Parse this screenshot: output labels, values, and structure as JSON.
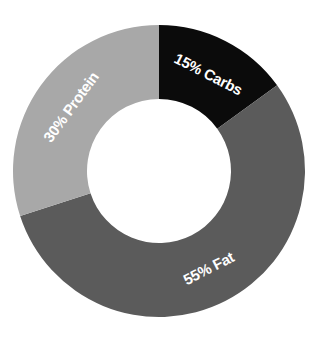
{
  "chart_data": {
    "type": "pie",
    "variant": "donut",
    "title": "",
    "categories": [
      "Carbs",
      "Fat",
      "Protein"
    ],
    "values": [
      15,
      55,
      30
    ],
    "unit": "%",
    "labels": [
      "15% Carbs",
      "55% Fat",
      "30% Protein"
    ],
    "colors": [
      "#0b0b0b",
      "#5b5b5b",
      "#a8a8a8"
    ],
    "start_angle_deg": 0,
    "direction": "clockwise",
    "legend": "none",
    "labels_position": "inside-segments"
  },
  "geometry": {
    "cx": 159,
    "cy": 171,
    "outer_r": 146,
    "inner_r": 72,
    "label_r": 109
  }
}
